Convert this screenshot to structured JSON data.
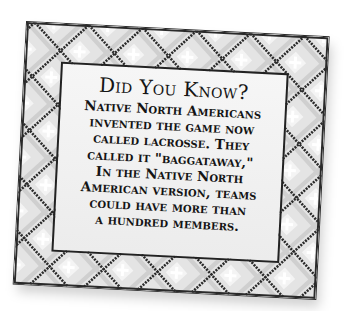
{
  "card": {
    "title": "Did You Know?",
    "body_lines": [
      "Native North Americans",
      "invented the game now",
      "called lacrosse. They",
      "called it \"baggataway,\"",
      "In the Native North",
      "American version, teams",
      "could have more than",
      "a hundred members."
    ],
    "colors": {
      "frame_base": "#cfcfcf",
      "frame_outline": "#2a2a2a",
      "diamond_light": "#e4e4e4",
      "diamond_center": "#ffffff",
      "panel_bg": "#f2f2f2",
      "text": "#141414"
    },
    "border_pattern": "diamond-lattice"
  }
}
